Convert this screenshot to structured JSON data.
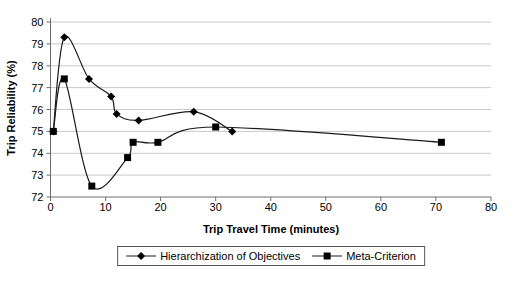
{
  "chart_data": {
    "type": "line",
    "title": "",
    "xlabel": "Trip Travel Time (minutes)",
    "ylabel": "Trip Reliability (%)",
    "xlim": [
      0,
      80
    ],
    "ylim": [
      72,
      80
    ],
    "xticks": [
      0,
      10,
      20,
      30,
      40,
      50,
      60,
      70,
      80
    ],
    "yticks": [
      72,
      73,
      74,
      75,
      76,
      77,
      78,
      79,
      80
    ],
    "grid": "horizontal",
    "legend_position": "bottom-center",
    "line_smoothing": true,
    "series": [
      {
        "name": "Hierarchization of Objectives",
        "marker": "diamond",
        "color": "#000000",
        "points": [
          [
            0.5,
            75.0
          ],
          [
            2.5,
            79.3
          ],
          [
            7,
            77.4
          ],
          [
            11,
            76.6
          ],
          [
            12,
            75.8
          ],
          [
            16,
            75.5
          ],
          [
            26,
            75.9
          ],
          [
            33,
            75.0
          ]
        ]
      },
      {
        "name": "Meta-Criterion",
        "marker": "square",
        "color": "#000000",
        "points": [
          [
            0.5,
            75.0
          ],
          [
            2.5,
            77.4
          ],
          [
            7.5,
            72.5
          ],
          [
            14,
            73.8
          ],
          [
            15,
            74.5
          ],
          [
            19.5,
            74.5
          ],
          [
            30,
            75.2
          ],
          [
            71,
            74.5
          ]
        ]
      }
    ],
    "colors": {
      "gridline": "#c9c9c9",
      "axis": "#6e6e6e",
      "series_line": "#1a1a1a",
      "text": "#000000",
      "background": "#ffffff"
    }
  }
}
